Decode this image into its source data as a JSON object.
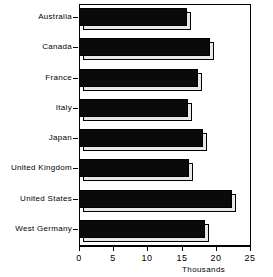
{
  "chart_data": {
    "type": "bar",
    "orientation": "horizontal",
    "title": "",
    "xlabel": "Thousands",
    "ylabel": "",
    "categories": [
      "Australia",
      "Canada",
      "France",
      "Italy",
      "Japan",
      "United Kingdom",
      "United States",
      "West Germany"
    ],
    "values": [
      15.8,
      19.1,
      17.4,
      15.9,
      18.1,
      16.1,
      22.3,
      18.4
    ],
    "xlim": [
      0,
      25
    ],
    "xticks": [
      0,
      5,
      10,
      15,
      20,
      25
    ],
    "xtick_labels": [
      "0",
      "5",
      "10",
      "15",
      "20",
      "25"
    ],
    "grid": false,
    "legend": null,
    "series": [
      {
        "name": "",
        "values": [
          15.8,
          19.1,
          17.4,
          15.9,
          18.1,
          16.1,
          22.3,
          18.4
        ]
      }
    ],
    "style": {
      "bar_fill": "#0a0a0a",
      "bar_shadow": "#e8e8e8",
      "frame": "#000000",
      "background": "#ffffff",
      "three_d": true
    }
  },
  "axis": {
    "unit_label": "Thousands"
  }
}
